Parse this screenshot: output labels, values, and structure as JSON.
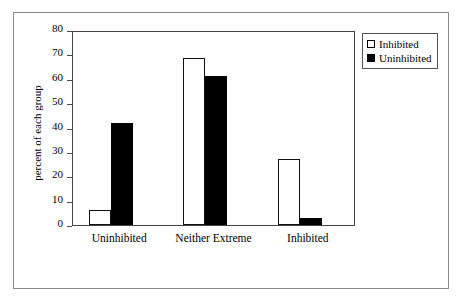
{
  "chart_data": {
    "type": "bar",
    "title": "",
    "subtitle": "",
    "xlabel": "",
    "ylabel": "percent of each group",
    "categories": [
      "Uninhibited",
      "Neither Extreme",
      "Inhibited"
    ],
    "series": [
      {
        "name": "Inhibited",
        "color": "#ffffff",
        "values": [
          6,
          68.5,
          27
        ]
      },
      {
        "name": "Uninhibited",
        "color": "#000000",
        "values": [
          42,
          61,
          3
        ]
      }
    ],
    "ylim": [
      0,
      80
    ],
    "ytick_step": 10,
    "yticks": [
      0,
      10,
      20,
      30,
      40,
      50,
      60,
      70,
      80
    ],
    "ytick_labels": [
      "0",
      "10",
      "20",
      "30",
      "40",
      "50",
      "60",
      "70",
      "80"
    ],
    "grid": false,
    "legend_position": "top-right-outside",
    "legend_entries": [
      "Inhibited",
      "Uninhibited"
    ]
  },
  "figure": {
    "frame_color": "#8a8a8a",
    "plot_border_color": "#444444",
    "background": "#ffffff"
  }
}
